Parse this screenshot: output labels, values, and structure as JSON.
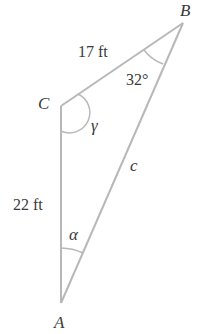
{
  "diagram": {
    "type": "triangle",
    "colors": {
      "line": "#b8b8b8",
      "text": "#3a3a3a",
      "background": "#ffffff"
    },
    "vertices": {
      "A": {
        "label": "A"
      },
      "B": {
        "label": "B"
      },
      "C": {
        "label": "C"
      }
    },
    "sides": {
      "CB": {
        "label": "17 ft"
      },
      "CA": {
        "label": "22 ft"
      },
      "AB": {
        "label": "c"
      }
    },
    "angles": {
      "B": {
        "label": "32°"
      },
      "C": {
        "label": "γ"
      },
      "A": {
        "label": "α"
      }
    }
  }
}
